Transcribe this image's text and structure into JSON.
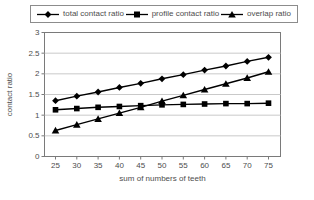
{
  "figure": {
    "background": "#ffffff",
    "plot_background": "#ffffff",
    "axis_color": "#7a7a7a",
    "grid_color": "#c9c9c9",
    "series_color": "#000000",
    "text_color": "#4d4d4d"
  },
  "legend": {
    "items": [
      {
        "label": "total contact ratio",
        "marker": "diamond"
      },
      {
        "label": "profile contact ratio",
        "marker": "square"
      },
      {
        "label": "overlap ratio",
        "marker": "triangle"
      }
    ]
  },
  "chart_data": {
    "type": "line",
    "title": "",
    "xlabel": "sum of numbers of teeth",
    "ylabel": "contact ratio",
    "x": [
      25,
      30,
      35,
      40,
      45,
      50,
      55,
      60,
      65,
      70,
      75
    ],
    "series": [
      {
        "name": "total contact ratio",
        "marker": "diamond",
        "values": [
          1.35,
          1.46,
          1.56,
          1.67,
          1.77,
          1.88,
          1.98,
          2.09,
          2.19,
          2.3,
          2.4
        ]
      },
      {
        "name": "profile contact ratio",
        "marker": "square",
        "values": [
          1.13,
          1.16,
          1.19,
          1.21,
          1.23,
          1.25,
          1.26,
          1.27,
          1.28,
          1.28,
          1.29
        ]
      },
      {
        "name": "overlap ratio",
        "marker": "triangle",
        "values": [
          0.63,
          0.77,
          0.91,
          1.05,
          1.19,
          1.34,
          1.48,
          1.62,
          1.76,
          1.9,
          2.05
        ]
      }
    ],
    "ylim": [
      0,
      3
    ],
    "ytick_step": 0.5,
    "yticks": [
      "0",
      "0.5",
      "1",
      "1.5",
      "2",
      "2.5",
      "3"
    ],
    "grid": true,
    "legend_position": "top"
  }
}
